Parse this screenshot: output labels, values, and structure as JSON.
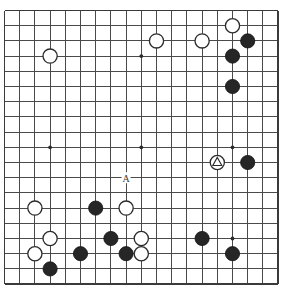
{
  "board": {
    "type": "go-board",
    "size": 19,
    "columns": 19,
    "rows": 19,
    "origin_x": 4.5,
    "origin_y": 10.5,
    "spacing": 15.2,
    "stone_radius": 7.1,
    "line_color": "#4a4a4a",
    "edge_color": "#3a3a3a",
    "background_color": "#ffffff",
    "black_color": "#262626",
    "white_color": "#ffffff",
    "star_points": [
      {
        "col": 3,
        "row": 3
      },
      {
        "col": 9,
        "row": 3
      },
      {
        "col": 15,
        "row": 3
      },
      {
        "col": 3,
        "row": 9
      },
      {
        "col": 9,
        "row": 9
      },
      {
        "col": 15,
        "row": 9
      },
      {
        "col": 3,
        "row": 15
      },
      {
        "col": 9,
        "row": 15
      },
      {
        "col": 15,
        "row": 15
      }
    ],
    "stones": [
      {
        "color": "white",
        "col": 15,
        "row": 1
      },
      {
        "color": "black",
        "col": 16,
        "row": 2
      },
      {
        "color": "white",
        "col": 10,
        "row": 2
      },
      {
        "color": "white",
        "col": 13,
        "row": 2
      },
      {
        "color": "white",
        "col": 3,
        "row": 3
      },
      {
        "color": "black",
        "col": 15,
        "row": 3
      },
      {
        "color": "black",
        "col": 15,
        "row": 5
      },
      {
        "color": "white",
        "col": 14,
        "row": 10,
        "mark": "triangle"
      },
      {
        "color": "black",
        "col": 16,
        "row": 10
      },
      {
        "color": "white",
        "col": 2,
        "row": 13
      },
      {
        "color": "black",
        "col": 6,
        "row": 13
      },
      {
        "color": "white",
        "col": 8,
        "row": 13
      },
      {
        "color": "white",
        "col": 3,
        "row": 15
      },
      {
        "color": "black",
        "col": 7,
        "row": 15
      },
      {
        "color": "white",
        "col": 9,
        "row": 15
      },
      {
        "color": "black",
        "col": 13,
        "row": 15
      },
      {
        "color": "white",
        "col": 2,
        "row": 16
      },
      {
        "color": "black",
        "col": 5,
        "row": 16
      },
      {
        "color": "black",
        "col": 8,
        "row": 16
      },
      {
        "color": "white",
        "col": 9,
        "row": 16
      },
      {
        "color": "black",
        "col": 15,
        "row": 16
      },
      {
        "color": "black",
        "col": 3,
        "row": 17
      }
    ],
    "labels": [
      {
        "text": "A",
        "col": 8,
        "row": 11
      }
    ]
  }
}
